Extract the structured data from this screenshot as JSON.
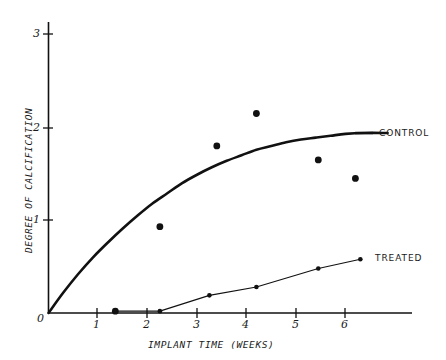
{
  "chart_data": {
    "type": "scatter",
    "title": "",
    "xlabel": "IMPLANT TIME (WEEKS)",
    "ylabel": "DEGREE OF CALCIFICATION",
    "xlim": [
      0,
      7.1
    ],
    "ylim": [
      0,
      3.3
    ],
    "xticks": [
      0,
      1,
      2,
      3,
      4,
      5,
      6
    ],
    "xtick_labels": [
      "0",
      "1",
      "2",
      "3",
      "4",
      "5",
      "6"
    ],
    "yticks": [
      1,
      2,
      3
    ],
    "ytick_labels": [
      "1",
      "2",
      "3"
    ],
    "grid": false,
    "legend_position": "right-inline",
    "series": [
      {
        "name": "CONTROL",
        "label": "CONTROL",
        "type": "scatter-with-fitted-curve",
        "marker": "filled-circle",
        "color": "#111111",
        "points": [
          {
            "x": 1.35,
            "y": 0.02
          },
          {
            "x": 2.25,
            "y": 0.93
          },
          {
            "x": 3.4,
            "y": 1.8
          },
          {
            "x": 4.2,
            "y": 2.15
          },
          {
            "x": 5.45,
            "y": 1.65
          },
          {
            "x": 6.2,
            "y": 1.45
          }
        ],
        "curve": {
          "description": "saturating exponential rise from origin to plateau",
          "plateau": 1.94,
          "points": [
            {
              "x": 0.0,
              "y": 0.0
            },
            {
              "x": 0.3,
              "y": 0.22
            },
            {
              "x": 0.6,
              "y": 0.42
            },
            {
              "x": 0.9,
              "y": 0.6
            },
            {
              "x": 1.2,
              "y": 0.76
            },
            {
              "x": 1.5,
              "y": 0.91
            },
            {
              "x": 1.8,
              "y": 1.05
            },
            {
              "x": 2.1,
              "y": 1.18
            },
            {
              "x": 2.4,
              "y": 1.29
            },
            {
              "x": 2.7,
              "y": 1.4
            },
            {
              "x": 3.0,
              "y": 1.49
            },
            {
              "x": 3.3,
              "y": 1.57
            },
            {
              "x": 3.6,
              "y": 1.64
            },
            {
              "x": 3.9,
              "y": 1.7
            },
            {
              "x": 4.2,
              "y": 1.76
            },
            {
              "x": 4.5,
              "y": 1.8
            },
            {
              "x": 4.8,
              "y": 1.84
            },
            {
              "x": 5.1,
              "y": 1.87
            },
            {
              "x": 5.4,
              "y": 1.89
            },
            {
              "x": 5.7,
              "y": 1.91
            },
            {
              "x": 6.0,
              "y": 1.93
            },
            {
              "x": 6.4,
              "y": 1.94
            },
            {
              "x": 6.85,
              "y": 1.94
            }
          ]
        }
      },
      {
        "name": "TREATED",
        "label": "TREATED",
        "type": "line-with-markers",
        "marker": "filled-circle",
        "color": "#111111",
        "points": [
          {
            "x": 1.35,
            "y": 0.02
          },
          {
            "x": 2.25,
            "y": 0.02
          },
          {
            "x": 3.25,
            "y": 0.19
          },
          {
            "x": 4.2,
            "y": 0.28
          },
          {
            "x": 5.45,
            "y": 0.48
          },
          {
            "x": 6.3,
            "y": 0.58
          }
        ]
      }
    ]
  },
  "axes": {
    "y_title": "DEGREE OF CALCIFICATION",
    "x_title": "IMPLANT TIME (WEEKS)",
    "x_tick_labels": [
      "0",
      "1",
      "2",
      "3",
      "4",
      "5",
      "6"
    ],
    "y_tick_labels": [
      "1",
      "2",
      "3"
    ],
    "origin_label": "0"
  },
  "legend": {
    "control_label": "CONTROL",
    "treated_label": "TREATED"
  }
}
